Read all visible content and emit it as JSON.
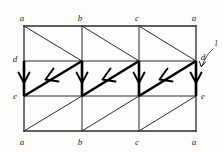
{
  "figure": {
    "background_color": "#fdfdfc",
    "line_color": "#2b2b2b",
    "bold_color": "#000000",
    "geometry": {
      "x_positions": [
        24,
        82,
        139,
        196
      ],
      "y_positions": [
        26,
        61,
        96,
        131
      ],
      "columns": 3,
      "rows": 3
    },
    "vertex_labels": {
      "top": [
        {
          "text": "a",
          "x": 24,
          "y": 26
        },
        {
          "text": "b",
          "x": 82,
          "y": 26
        },
        {
          "text": "c",
          "x": 139,
          "y": 26
        },
        {
          "text": "a",
          "x": 196,
          "y": 26
        }
      ],
      "bottom": [
        {
          "text": "a",
          "x": 24,
          "y": 131
        },
        {
          "text": "b",
          "x": 82,
          "y": 131
        },
        {
          "text": "c",
          "x": 139,
          "y": 131
        },
        {
          "text": "a",
          "x": 196,
          "y": 131
        }
      ],
      "left": [
        {
          "text": "d",
          "x": 24,
          "y": 61
        },
        {
          "text": "e",
          "x": 24,
          "y": 96
        }
      ],
      "right": [
        {
          "text": "d",
          "x": 196,
          "y": 61
        },
        {
          "text": "e",
          "x": 196,
          "y": 96
        }
      ]
    },
    "annotation": {
      "label": "1",
      "label_x": 214,
      "label_y": 48,
      "points_to_x": 196,
      "points_to_y": 68,
      "description": "curved leader arrow labelled 1 pointing at the right-hand bold vertical edge d-e"
    },
    "bands": {
      "top": {
        "name": "top-band",
        "y_top": 26,
        "y_bottom": 61,
        "diagonal_direction": "top-left-to-bottom-right",
        "stroke": "thin"
      },
      "middle": {
        "name": "middle-band",
        "y_top": 61,
        "y_bottom": 96,
        "diagonal_direction": "bottom-left-to-top-right",
        "stroke": "bold",
        "arrows": "arrowheads point down-left along diagonals and down along verticals"
      },
      "bottom": {
        "name": "bottom-band",
        "y_top": 96,
        "y_bottom": 131,
        "diagonal_direction": "bottom-left-to-top-right",
        "stroke": "thin"
      }
    },
    "bold_vertical_arrows": [
      {
        "x": 24,
        "y_from": 61,
        "y_to": 96
      },
      {
        "x": 82,
        "y_from": 61,
        "y_to": 96
      },
      {
        "x": 139,
        "y_from": 61,
        "y_to": 96
      },
      {
        "x": 196,
        "y_from": 61,
        "y_to": 96
      }
    ],
    "bold_diagonal_arrows": [
      {
        "x_from": 82,
        "y_from": 61,
        "x_to": 24,
        "y_to": 96
      },
      {
        "x_from": 139,
        "y_from": 61,
        "x_to": 82,
        "y_to": 96
      },
      {
        "x_from": 196,
        "y_from": 61,
        "x_to": 139,
        "y_to": 96
      }
    ]
  }
}
